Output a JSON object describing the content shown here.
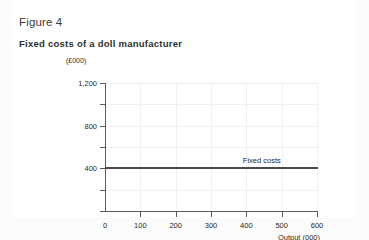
{
  "figure": {
    "title": "Figure 4",
    "subtitle": "Fixed costs of a doll manufacturer"
  },
  "chart_data": {
    "type": "line",
    "title": "Fixed costs of a doll manufacturer",
    "xlabel": "Output (000)",
    "ylabel": "(£000)",
    "xlim": [
      0,
      600
    ],
    "ylim": [
      0,
      1200
    ],
    "xticks": [
      0,
      100,
      200,
      300,
      400,
      500,
      600
    ],
    "xticklabels": [
      "0",
      "100",
      "200",
      "300",
      "400",
      "500",
      "600"
    ],
    "yticks": [
      0,
      200,
      400,
      600,
      800,
      1000,
      1200
    ],
    "yticklabels": [
      "",
      "",
      "400",
      "",
      "800",
      "",
      "1,200"
    ],
    "grid": true,
    "legend": "none",
    "series": [
      {
        "name": "Fixed costs",
        "annotation": "Fixed costs",
        "constant_value": 400,
        "x": [
          0,
          600
        ],
        "values": [
          400,
          400
        ],
        "color": "#4a4a4a"
      }
    ]
  },
  "colors": {
    "page_background": "#fbfbfb",
    "card_background": "#ffffff",
    "axis": "#5a5a5a",
    "gridline": "#f0f0f0",
    "series": "#4a4a4a",
    "text": "#1f1f1f"
  }
}
